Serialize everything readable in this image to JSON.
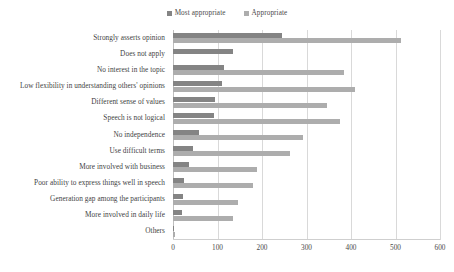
{
  "chart_data": {
    "type": "bar",
    "orientation": "horizontal",
    "title": "",
    "subtitle": "",
    "xlabel": "",
    "ylabel": "",
    "xlim": [
      0,
      600
    ],
    "xticks": [
      0,
      100,
      200,
      300,
      400,
      500,
      600
    ],
    "grid": true,
    "legend_position": "top-center",
    "categories": [
      "Strongly asserts opinion",
      "Does not apply",
      "No interest in the topic",
      "Low flexibility in understanding others' opinions",
      "Different sense of values",
      "Speech is not logical",
      "No independence",
      "Use difficult terms",
      "More involved with business",
      "Poor ability to express things well in speech",
      "Generation gap among the participants",
      "More involved in daily life",
      "Others"
    ],
    "series": [
      {
        "name": "Most appropriate",
        "color": "#848484",
        "values": [
          245,
          135,
          115,
          110,
          95,
          92,
          58,
          44,
          35,
          24,
          22,
          20,
          3
        ]
      },
      {
        "name": "Appropriate",
        "color": "#adadad",
        "values": [
          512,
          0,
          385,
          410,
          345,
          375,
          293,
          262,
          188,
          180,
          145,
          135,
          4
        ]
      }
    ]
  },
  "legend": {
    "items": [
      {
        "label": "Most appropriate",
        "color": "#848484"
      },
      {
        "label": "Appropriate",
        "color": "#adadad"
      }
    ]
  },
  "axis": {
    "tick_labels": [
      "0",
      "100",
      "200",
      "300",
      "400",
      "500",
      "600"
    ]
  }
}
